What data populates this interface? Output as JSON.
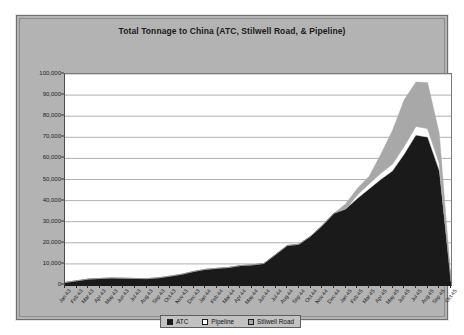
{
  "chart": {
    "title": "Total Tonnage to China (ATC, Stilwell Road, & Pipeline)",
    "legend": {
      "atc_label": "ATC",
      "pipeline_label": "Pipeline",
      "stilwell_label": "Stilwell Road"
    },
    "colors": {
      "atc": "#1a1a1a",
      "pipeline": "#ffffff",
      "stilwell": "#a8a8a8",
      "plot_background": "#ffffff",
      "chart_background": "#b3b3b3",
      "gridline": "#9a9a9a"
    }
  },
  "chart_data": {
    "type": "area",
    "stacked": true,
    "title": "Total Tonnage to China (ATC, Stilwell Road, & Pipeline)",
    "xlabel": "",
    "ylabel": "",
    "ylim": [
      0,
      100000
    ],
    "ytick_values": [
      0,
      10000,
      20000,
      30000,
      40000,
      50000,
      60000,
      70000,
      80000,
      90000,
      100000
    ],
    "ytick_labels": [
      "0",
      "10,000",
      "20,000",
      "30,000",
      "40,000",
      "50,000",
      "60,000",
      "70,000",
      "80,000",
      "90,000",
      "100,000"
    ],
    "grid": true,
    "legend_position": "bottom",
    "categories": [
      "Jan 43",
      "Feb 43",
      "Mar 43",
      "Apr 43",
      "May 43",
      "Jun 43",
      "Jul 43",
      "Aug 43",
      "Sep 43",
      "Oct 43",
      "Nov 43",
      "Dec 43",
      "Jan 44",
      "Feb 44",
      "Mar 44",
      "Apr 44",
      "May 44",
      "Jun 44",
      "Jul 44",
      "Aug 44",
      "Sep 44",
      "Oct 44",
      "Nov 44",
      "Dec 44",
      "Jan 45",
      "Feb 45",
      "Mar 45",
      "Apr 45",
      "May 45",
      "Jun 45",
      "Jul 45",
      "Aug 45",
      "Sep 45",
      "Oct 45"
    ],
    "series": [
      {
        "name": "ATC",
        "values": [
          1200,
          2000,
          2800,
          3100,
          3300,
          3200,
          3100,
          3000,
          3400,
          4200,
          5100,
          6400,
          7400,
          7900,
          8300,
          9200,
          9500,
          10200,
          14400,
          18700,
          19300,
          23100,
          28200,
          34000,
          36000,
          41000,
          45500,
          50000,
          54000,
          62000,
          71000,
          70000,
          54000,
          1500
        ]
      },
      {
        "name": "Pipeline",
        "values": [
          0,
          0,
          0,
          0,
          0,
          0,
          0,
          0,
          0,
          0,
          0,
          0,
          0,
          0,
          0,
          0,
          0,
          0,
          0,
          0,
          0,
          0,
          0,
          0,
          0,
          1800,
          2500,
          3000,
          3400,
          3800,
          4200,
          4200,
          3800,
          300
        ]
      },
      {
        "name": "Stilwell Road",
        "values": [
          0,
          0,
          0,
          0,
          0,
          0,
          0,
          0,
          0,
          0,
          0,
          0,
          0,
          0,
          0,
          0,
          0,
          0,
          0,
          0,
          0,
          0,
          0,
          0,
          2500,
          3000,
          3500,
          9000,
          16000,
          22000,
          21000,
          21800,
          14000,
          600
        ]
      }
    ],
    "peak": {
      "category": "Jul 45",
      "total": 96000
    }
  }
}
